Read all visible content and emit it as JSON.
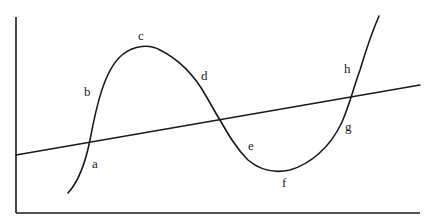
{
  "diagram": {
    "type": "curve-and-line",
    "colors": {
      "ink": "#1a1a1a",
      "background": "#ffffff"
    },
    "labels": [
      {
        "id": "a",
        "text": "a",
        "x": 92,
        "y": 168
      },
      {
        "id": "b",
        "text": "b",
        "x": 84,
        "y": 96
      },
      {
        "id": "c",
        "text": "c",
        "x": 138,
        "y": 40
      },
      {
        "id": "d",
        "text": "d",
        "x": 201,
        "y": 80
      },
      {
        "id": "e",
        "text": "e",
        "x": 248,
        "y": 150
      },
      {
        "id": "f",
        "text": "f",
        "x": 282,
        "y": 187
      },
      {
        "id": "g",
        "text": "g",
        "x": 345,
        "y": 131
      },
      {
        "id": "h",
        "text": "h",
        "x": 344,
        "y": 73
      }
    ]
  }
}
